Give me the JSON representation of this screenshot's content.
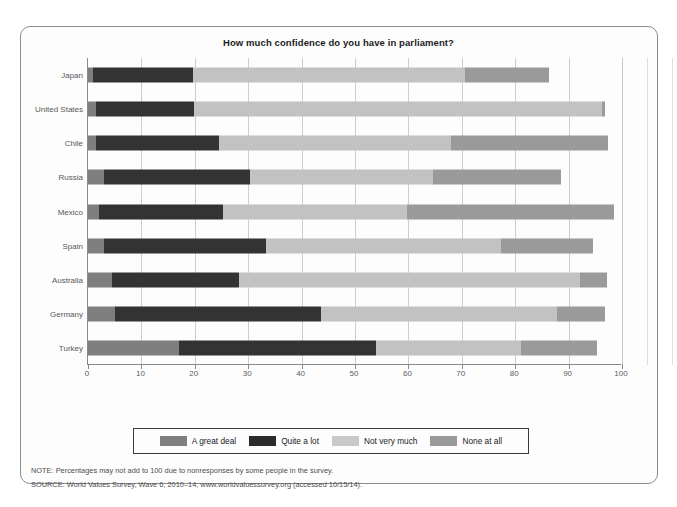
{
  "chart_data": {
    "type": "bar",
    "orientation": "horizontal",
    "stacked": true,
    "title": "How much confidence do you have in parliament?",
    "xlabel": "",
    "ylabel": "",
    "xlim": [
      0,
      100
    ],
    "xticks": [
      0,
      10,
      20,
      30,
      40,
      50,
      60,
      70,
      80,
      90,
      100
    ],
    "xtick_labels": [
      "0",
      "10",
      "20",
      "30",
      "40",
      "50",
      "60",
      "70",
      "80",
      "90",
      "100"
    ],
    "grid": "vertical",
    "legend_position": "bottom",
    "categories": [
      "Japan",
      "United States",
      "Chile",
      "Russia",
      "Mexico",
      "Spain",
      "Australia",
      "Germany",
      "Turkey"
    ],
    "series": [
      {
        "name": "A great deal",
        "color": "#7f7f7f",
        "values": [
          1,
          1.5,
          1.5,
          3,
          2,
          3,
          4.5,
          5,
          17
        ]
      },
      {
        "name": "Quite a lot",
        "color": "#333333",
        "values": [
          18.6,
          18.4,
          23,
          27.3,
          23.3,
          30.3,
          23.7,
          38.6,
          37
        ]
      },
      {
        "name": "Not very much",
        "color": "#c2c2c2",
        "values": [
          51,
          76.4,
          43.5,
          34.3,
          34.5,
          44,
          64,
          44.3,
          27
        ]
      },
      {
        "name": "None at all",
        "color": "#9a9a9a",
        "values": [
          15.7,
          0.5,
          29.4,
          24,
          38.7,
          17.3,
          5,
          8.9,
          14.3
        ]
      }
    ],
    "cumulative_endpoints": {
      "Japan": [
        1,
        19.6,
        70.6,
        86.3
      ],
      "United States": [
        1.5,
        19.9,
        96.3,
        96.8
      ],
      "Chile": [
        1.5,
        24.5,
        68,
        97.4
      ],
      "Russia": [
        3,
        30.3,
        64.6,
        88.6
      ],
      "Mexico": [
        2,
        25.3,
        59.8,
        98.5
      ],
      "Spain": [
        3,
        33.3,
        77.3,
        94.6
      ],
      "Australia": [
        4.5,
        28.2,
        92.2,
        97.2
      ],
      "Germany": [
        5,
        43.6,
        87.9,
        96.8
      ],
      "Turkey": [
        17,
        54,
        81,
        95.3
      ]
    }
  },
  "notes": [
    "NOTE: Percentages may not add to 100 due to nonresponses by some people in the survey.",
    "SOURCE: World Values Survey, Wave 6, 2010–14, www.worldvaluessurvey.org (accessed 10/15/14)."
  ]
}
